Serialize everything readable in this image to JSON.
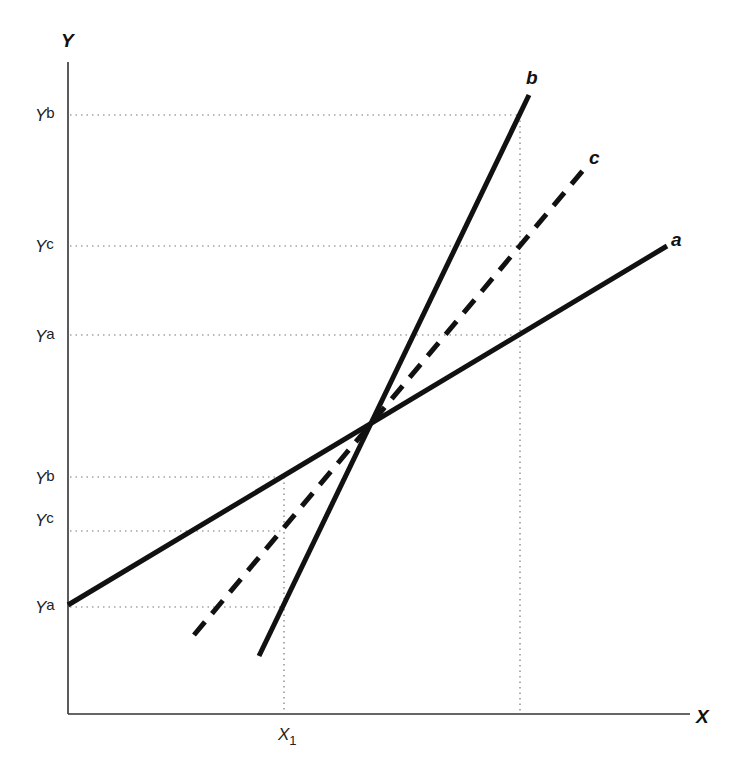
{
  "diagram": {
    "axes": {
      "y_title": "Y",
      "x_title": "X"
    },
    "x_ticks": [
      {
        "main": "X",
        "sub": "1"
      }
    ],
    "y_ticks_upper": [
      {
        "main": "Y",
        "sup": "b"
      },
      {
        "main": "Y",
        "sup": "c"
      },
      {
        "main": "Y",
        "sup": "a"
      }
    ],
    "y_ticks_lower": [
      {
        "main": "Y",
        "sup": "b"
      },
      {
        "main": "Y",
        "sup": "c"
      },
      {
        "main": "Y",
        "sup": "a"
      }
    ],
    "lines": [
      {
        "id": "a",
        "label": "a",
        "style": "solid"
      },
      {
        "id": "b",
        "label": "b",
        "style": "solid"
      },
      {
        "id": "c",
        "label": "c",
        "style": "dashed"
      }
    ],
    "colors": {
      "line": "#111111",
      "axis": "#333333",
      "guide": "#777777",
      "background": "#ffffff"
    }
  }
}
